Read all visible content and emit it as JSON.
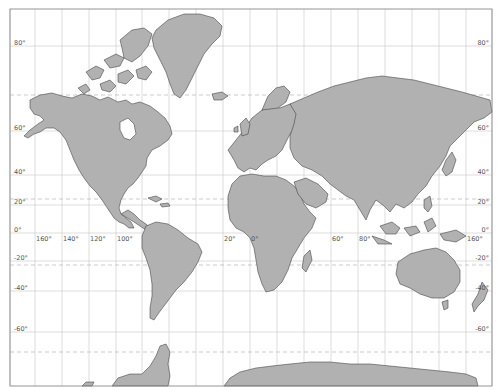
{
  "map": {
    "projection": "Mercator",
    "frame": {
      "x": 10,
      "y": 9,
      "width": 482,
      "height": 377
    },
    "colors": {
      "land": "#b1b1b1",
      "coast": "#3a3a3a",
      "ocean": "#ffffff",
      "grid": "#c8c8c8",
      "special_parallels": "#b4b4b4",
      "labels": "#555555"
    },
    "latitude_labels_left": [
      {
        "text": "80°",
        "y": 46
      },
      {
        "text": "60°",
        "y": 131
      },
      {
        "text": "40°",
        "y": 175
      },
      {
        "text": "20°",
        "y": 205
      },
      {
        "text": "0°",
        "y": 233
      },
      {
        "text": "-20°",
        "y": 261
      },
      {
        "text": "-40°",
        "y": 291
      },
      {
        "text": "-60°",
        "y": 332
      }
    ],
    "latitude_labels_right": [
      {
        "text": "80°",
        "y": 46
      },
      {
        "text": "60°",
        "y": 131
      },
      {
        "text": "40°",
        "y": 175
      },
      {
        "text": "20°",
        "y": 205
      },
      {
        "text": "0°",
        "y": 233
      },
      {
        "text": "-20°",
        "y": 261
      },
      {
        "text": "-40°",
        "y": 291
      },
      {
        "text": "-60°",
        "y": 332
      }
    ],
    "longitude_labels": [
      {
        "text": "160°",
        "x": 35
      },
      {
        "text": "140°",
        "x": 62
      },
      {
        "text": "120°",
        "x": 89
      },
      {
        "text": "100°",
        "x": 116
      },
      {
        "text": "20°",
        "x": 223
      },
      {
        "text": "0°",
        "x": 250
      },
      {
        "text": "60°",
        "x": 331
      },
      {
        "text": "80°",
        "x": 358
      },
      {
        "text": "160°",
        "x": 466
      }
    ],
    "meridians_x": [
      10,
      35,
      62,
      89,
      116,
      142,
      169,
      196,
      223,
      250,
      277,
      304,
      331,
      358,
      385,
      412,
      439,
      466,
      492
    ],
    "parallels_y": [
      46,
      131,
      175,
      205,
      233,
      261,
      291,
      332
    ],
    "special_parallels_y": [
      95,
      199,
      265,
      352
    ],
    "regions": [
      "North America",
      "Greenland",
      "South America",
      "Europe",
      "Africa",
      "Asia",
      "Australia",
      "New Zealand",
      "Antarctica",
      "Arctic Archipelago"
    ]
  }
}
